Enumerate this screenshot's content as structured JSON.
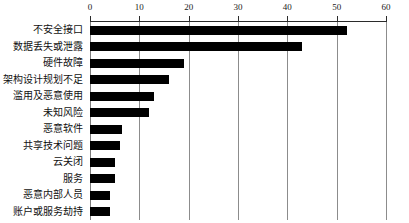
{
  "chart_data": {
    "type": "bar",
    "orientation": "horizontal",
    "title": "",
    "subtitle": "",
    "xlabel": "",
    "ylabel": "",
    "xlim": [
      0,
      60
    ],
    "ylim": null,
    "grid": true,
    "grid_axis": "x",
    "legend": false,
    "legend_position": "none",
    "xaxis_position": "top",
    "xticks": [
      0,
      10,
      20,
      30,
      40,
      50,
      60
    ],
    "xtick_labels": [
      "0",
      "10",
      "20",
      "30",
      "40",
      "50",
      "60"
    ],
    "categories": [
      "不安全接口",
      "数据丢失或泄露",
      "硬件故障",
      "架构设计规划不足",
      "滥用及恶意使用",
      "未知风险",
      "恶意软件",
      "共享技术问题",
      "云关闭",
      "服务",
      "恶意内部人员",
      "账户或服务劫持"
    ],
    "values": [
      52,
      43,
      19,
      16,
      13,
      12,
      6.5,
      6,
      5,
      5,
      4,
      4
    ],
    "bar_color": "#000000",
    "grid_color": "#8c8c8c",
    "axis_color": "#2b2b2b",
    "background_color": "#ffffff"
  }
}
